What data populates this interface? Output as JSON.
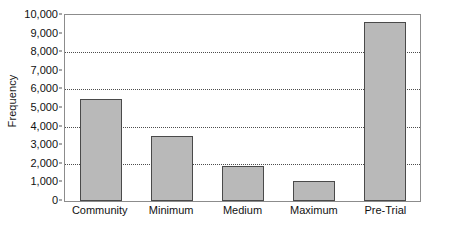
{
  "chart_data": {
    "type": "bar",
    "title": "",
    "subtitle": "",
    "xlabel": "",
    "ylabel": "Frequency",
    "categories": [
      "Community",
      "Minimum",
      "Medium",
      "Maximum",
      "Pre-Trial"
    ],
    "values": [
      5500,
      3500,
      1900,
      1050,
      9600
    ],
    "ylim": [
      0,
      10000
    ],
    "ytick_values": [
      0,
      1000,
      2000,
      3000,
      4000,
      5000,
      6000,
      7000,
      8000,
      9000,
      10000
    ],
    "ytick_labels": [
      "0",
      "1,000",
      "2,000",
      "3,000",
      "4,000",
      "5,000",
      "6,000",
      "7,000",
      "8,000",
      "9,000",
      "10,000"
    ],
    "gridline_values": [
      2000,
      4000,
      6000,
      8000
    ],
    "grid": true,
    "legend": false,
    "legend_position": "none",
    "bar_fill_color": "#b9b9b9",
    "bar_border_color": "#4a4a4a",
    "grid_color": "#4d4d4d",
    "frame_color": "#8c8c8c",
    "background_color": "#ffffff",
    "text_color": "#111111"
  }
}
